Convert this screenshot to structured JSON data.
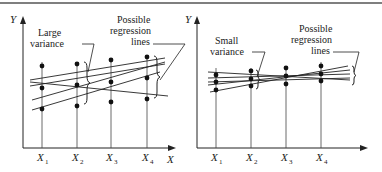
{
  "figure": {
    "top_rule": true,
    "colors": {
      "ink": "#222222",
      "background": "#ffffff"
    }
  },
  "panels": [
    {
      "id": "left",
      "y_axis_label": "Y",
      "x_axis_label": "X",
      "x_ticks": [
        {
          "base": "X",
          "sub": "1"
        },
        {
          "base": "X",
          "sub": "2"
        },
        {
          "base": "X",
          "sub": "3"
        },
        {
          "base": "X",
          "sub": "4"
        }
      ],
      "annotation_variance": [
        "Large",
        "variance"
      ],
      "annotation_lines": [
        "Possible",
        "regression",
        "lines"
      ]
    },
    {
      "id": "right",
      "y_axis_label": "Y",
      "x_axis_label": "",
      "x_ticks": [
        {
          "base": "X",
          "sub": "1"
        },
        {
          "base": "X",
          "sub": "2"
        },
        {
          "base": "X",
          "sub": "3"
        },
        {
          "base": "X",
          "sub": "4"
        }
      ],
      "annotation_variance": [
        "Small",
        "variance"
      ],
      "annotation_lines": [
        "Possible",
        "regression",
        "lines"
      ]
    }
  ]
}
